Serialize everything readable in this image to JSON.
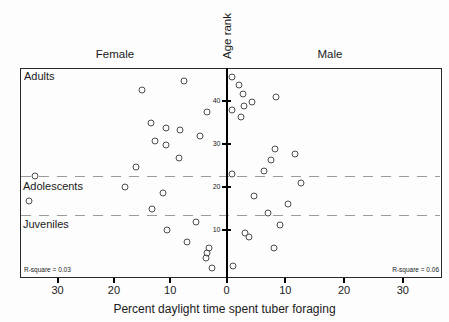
{
  "chart_data": {
    "type": "scatter",
    "title": "",
    "xlabel": "Percent daylight time spent tuber foraging",
    "ylabel": "Age rank",
    "legend": "none",
    "grid": "off",
    "panel_headers": {
      "left": "Female",
      "right": "Male"
    },
    "region_labels": {
      "adults": "Adults",
      "adolescents": "Adolescents",
      "juveniles": "Juveniles"
    },
    "annotations": {
      "left_rsquare": "R-square = 0.03",
      "right_rsquare": "R-square = 0.06"
    },
    "x_ticks": {
      "left": [
        30,
        20,
        10,
        0
      ],
      "right": [
        10,
        20,
        30
      ]
    },
    "y_ticks": [
      10,
      20,
      30,
      40
    ],
    "xlim_each_side": [
      0,
      36.5
    ],
    "ylim": [
      -1,
      47.7
    ],
    "dashed_lines_y": [
      22.6,
      13.6
    ],
    "series": [
      {
        "name": "Female",
        "side": "left",
        "points": [
          [
            7.6,
            44.6
          ],
          [
            15.0,
            42.4
          ],
          [
            3.4,
            37.3
          ],
          [
            13.4,
            34.8
          ],
          [
            10.8,
            33.6
          ],
          [
            8.3,
            33.3
          ],
          [
            4.7,
            31.9
          ],
          [
            12.7,
            30.7
          ],
          [
            10.8,
            29.8
          ],
          [
            8.5,
            26.7
          ],
          [
            16.0,
            24.7
          ],
          [
            34.0,
            22.5
          ],
          [
            18.0,
            20.0
          ],
          [
            11.2,
            18.5
          ],
          [
            35.0,
            16.7
          ],
          [
            13.2,
            14.9
          ],
          [
            5.4,
            11.8
          ],
          [
            10.5,
            9.9
          ],
          [
            7.0,
            7.3
          ],
          [
            3.1,
            5.8
          ],
          [
            3.4,
            4.6
          ],
          [
            3.6,
            3.6
          ],
          [
            2.6,
            1.2
          ]
        ]
      },
      {
        "name": "Male",
        "side": "right",
        "points": [
          [
            0.9,
            45.6
          ],
          [
            2.2,
            43.7
          ],
          [
            2.8,
            41.6
          ],
          [
            8.4,
            40.8
          ],
          [
            4.4,
            39.7
          ],
          [
            3.0,
            38.8
          ],
          [
            1.0,
            37.9
          ],
          [
            2.4,
            36.2
          ],
          [
            8.3,
            28.8
          ],
          [
            11.6,
            27.6
          ],
          [
            7.6,
            26.2
          ],
          [
            6.3,
            23.8
          ],
          [
            0.9,
            23.0
          ],
          [
            12.7,
            20.9
          ],
          [
            4.7,
            18.0
          ],
          [
            10.5,
            16.1
          ],
          [
            7.0,
            13.9
          ],
          [
            9.1,
            11.2
          ],
          [
            3.2,
            9.3
          ],
          [
            3.9,
            8.4
          ],
          [
            8.0,
            5.9
          ],
          [
            1.1,
            1.7
          ]
        ]
      }
    ]
  }
}
